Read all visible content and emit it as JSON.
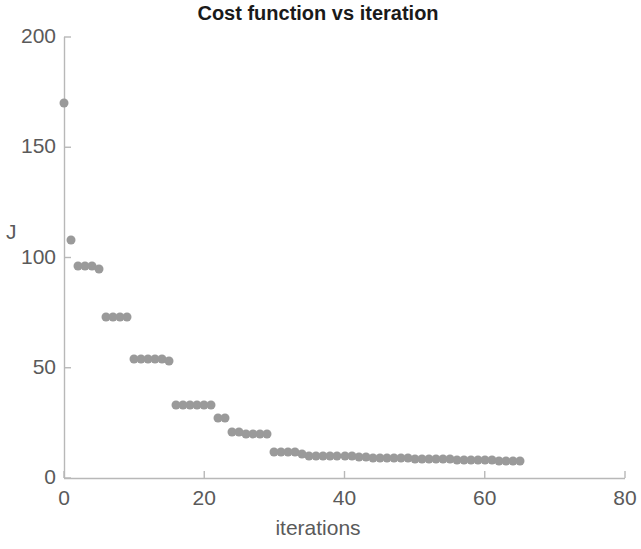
{
  "chart_data": {
    "type": "scatter",
    "title": "Cost function vs iteration",
    "xlabel": "iterations",
    "ylabel": "J",
    "xlim": [
      0,
      80
    ],
    "ylim": [
      0,
      200
    ],
    "xticks": [
      0,
      20,
      40,
      60,
      80
    ],
    "yticks": [
      0,
      50,
      100,
      150,
      200
    ],
    "grid": false,
    "legend": null,
    "marker_color": "#9a9a9a",
    "marker_size": 9,
    "series": [
      {
        "name": "J",
        "x": [
          0,
          1,
          2,
          3,
          4,
          5,
          6,
          7,
          8,
          9,
          10,
          11,
          12,
          13,
          14,
          15,
          16,
          17,
          18,
          19,
          20,
          21,
          22,
          23,
          24,
          25,
          26,
          27,
          28,
          29,
          30,
          31,
          32,
          33,
          34,
          35,
          36,
          37,
          38,
          39,
          40,
          41,
          42,
          43,
          44,
          45,
          46,
          47,
          48,
          49,
          50,
          51,
          52,
          53,
          54,
          55,
          56,
          57,
          58,
          59,
          60,
          61,
          62,
          63,
          64,
          65
        ],
        "y": [
          170,
          108,
          96,
          96,
          96,
          95,
          73,
          73,
          73,
          73,
          54,
          54,
          54,
          54,
          54,
          53,
          33,
          33,
          33,
          33,
          33,
          33,
          27,
          27,
          21,
          21,
          20,
          20,
          20,
          20,
          12,
          12,
          12,
          12,
          11,
          10,
          10,
          10,
          10,
          10,
          10,
          10,
          9.5,
          9.5,
          9,
          9,
          9,
          9,
          9,
          9,
          8.5,
          8.5,
          8.5,
          8.5,
          8.5,
          8.5,
          8,
          8,
          8,
          8,
          8,
          8,
          7.5,
          7.5,
          7.5,
          7.5
        ]
      }
    ]
  },
  "axis": {
    "y_tick_labels": [
      "200",
      "150",
      "100",
      "50",
      "0"
    ],
    "x_tick_labels": [
      "0",
      "20",
      "40",
      "60",
      "80"
    ]
  }
}
